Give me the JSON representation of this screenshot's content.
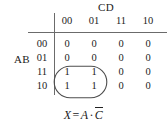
{
  "figure": {
    "type": "karnaugh-map",
    "column_variable_label": "CD",
    "row_variable_label": "AB",
    "column_headers": [
      "00",
      "01",
      "11",
      "10"
    ],
    "row_headers": [
      "00",
      "01",
      "11",
      "10"
    ],
    "cells": [
      [
        "0",
        "0",
        "0",
        "0"
      ],
      [
        "0",
        "0",
        "0",
        "0"
      ],
      [
        "1",
        "1",
        "0",
        "0"
      ],
      [
        "1",
        "1",
        "0",
        "0"
      ]
    ],
    "grouping": {
      "name": "prime-implicant-loop",
      "covers_rows": [
        "11",
        "10"
      ],
      "covers_columns": [
        "00",
        "01"
      ],
      "shape": "rounded-oval"
    },
    "expression": {
      "output": "X",
      "equals": "=",
      "term1": "A",
      "operator": "·",
      "term2": "C",
      "term2_complemented": true,
      "full_text": "X = A · C̄"
    },
    "colors": {
      "background": "#ffffff",
      "ink": "#222222",
      "rule": "#6b6b6b",
      "loop": "#4d4d4d"
    }
  }
}
